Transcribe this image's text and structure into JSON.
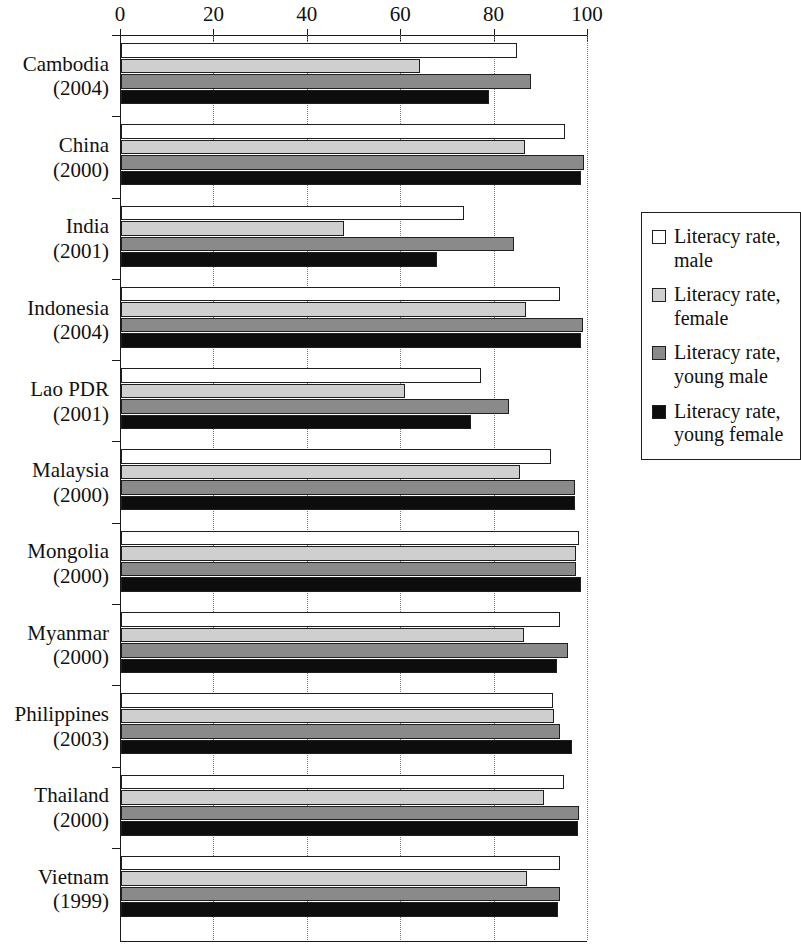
{
  "chart_data": {
    "type": "bar",
    "orientation": "horizontal",
    "title": "",
    "subtitle": "",
    "xlabel": "",
    "ylabel": "",
    "xlim": [
      0,
      100
    ],
    "xticks": [
      0,
      20,
      40,
      60,
      80,
      100
    ],
    "xtick_labels": [
      "0",
      "20",
      "40",
      "60",
      "80",
      "100"
    ],
    "grid": true,
    "grid_axis": "x",
    "legend_position": "right",
    "categories": [
      "Cambodia (2004)",
      "China (2000)",
      "India (2001)",
      "Indonesia (2004)",
      "Lao PDR (2001)",
      "Malaysia (2000)",
      "Mongolia (2000)",
      "Myanmar (2000)",
      "Philippines (2003)",
      "Thailand (2000)",
      "Vietnam (1999)"
    ],
    "series": [
      {
        "name": "Literacy rate, male",
        "color": "#ffffff",
        "values": [
          84.7,
          95.1,
          73.4,
          94.0,
          77.0,
          92.0,
          98.0,
          93.9,
          92.5,
          94.9,
          93.9
        ]
      },
      {
        "name": "Literacy rate, female",
        "color": "#cfcfcf",
        "values": [
          64.1,
          86.5,
          47.8,
          86.8,
          60.9,
          85.4,
          97.5,
          86.4,
          92.7,
          90.5,
          86.9
        ]
      },
      {
        "name": "Literacy rate, young male",
        "color": "#8a8a8a",
        "values": [
          87.9,
          99.2,
          84.2,
          98.9,
          83.0,
          97.2,
          97.4,
          95.8,
          94.0,
          98.1,
          94.1
        ]
      },
      {
        "name": "Literacy rate, young female",
        "color": "#0d0d0d",
        "values": [
          78.9,
          98.5,
          67.7,
          98.5,
          75.0,
          97.3,
          98.4,
          93.4,
          96.6,
          97.8,
          93.6
        ]
      }
    ]
  },
  "rows": [
    {
      "country": "Cambodia",
      "year": "(2004)"
    },
    {
      "country": "China",
      "year": "(2000)"
    },
    {
      "country": "India",
      "year": "(2001)"
    },
    {
      "country": "Indonesia",
      "year": "(2004)"
    },
    {
      "country": "Lao PDR",
      "year": "(2001)"
    },
    {
      "country": "Malaysia",
      "year": "(2000)"
    },
    {
      "country": "Mongolia",
      "year": "(2000)"
    },
    {
      "country": "Myanmar",
      "year": "(2000)"
    },
    {
      "country": "Philippines",
      "year": "(2003)"
    },
    {
      "country": "Thailand",
      "year": "(2000)"
    },
    {
      "country": "Vietnam",
      "year": "(1999)"
    }
  ],
  "legend": {
    "items": [
      {
        "line1": "Literacy rate,",
        "line2": "male"
      },
      {
        "line1": "Literacy rate,",
        "line2": "female"
      },
      {
        "line1": "Literacy rate,",
        "line2": "young male"
      },
      {
        "line1": "Literacy rate,",
        "line2": "young female"
      }
    ]
  }
}
